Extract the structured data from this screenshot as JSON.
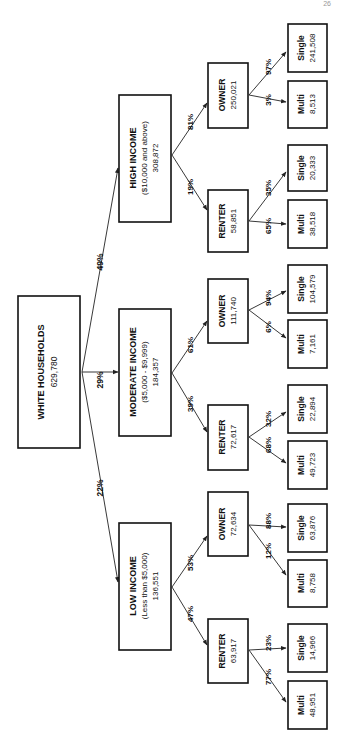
{
  "page_number": "26",
  "root": {
    "title": "WHITE HOUSEHOLDS",
    "value": "629,780"
  },
  "income": {
    "high": {
      "title": "HIGH INCOME",
      "range": "($10,000 and above)",
      "value": "308,872",
      "pct": "49%"
    },
    "moderate": {
      "title": "MODERATE INCOME",
      "range": "($5,000 - $9,999)",
      "value": "184,357",
      "pct": "29%"
    },
    "low": {
      "title": "LOW INCOME",
      "range": "(Less than $5,000)",
      "value": "136,551",
      "pct": "22%"
    }
  },
  "tenure": {
    "high_owner": {
      "title": "OWNER",
      "value": "250,021",
      "pct": "81%"
    },
    "high_renter": {
      "title": "RENTER",
      "value": "58,851",
      "pct": "19%"
    },
    "mod_owner": {
      "title": "OWNER",
      "value": "111,740",
      "pct": "61%"
    },
    "mod_renter": {
      "title": "RENTER",
      "value": "72,617",
      "pct": "39%"
    },
    "low_owner": {
      "title": "OWNER",
      "value": "72,634",
      "pct": "53%"
    },
    "low_renter": {
      "title": "RENTER",
      "value": "63,917",
      "pct": "47%"
    }
  },
  "leaves": {
    "high_owner_single": {
      "title": "Single",
      "value": "241,508",
      "pct": "97%"
    },
    "high_owner_multi": {
      "title": "Multi",
      "value": "8,513",
      "pct": "3%"
    },
    "high_renter_single": {
      "title": "Single",
      "value": "20,333",
      "pct": "35%"
    },
    "high_renter_multi": {
      "title": "Multi",
      "value": "38,518",
      "pct": "65%"
    },
    "mod_owner_single": {
      "title": "Single",
      "value": "104,579",
      "pct": "94%"
    },
    "mod_owner_multi": {
      "title": "Multi",
      "value": "7,161",
      "pct": "6%"
    },
    "mod_renter_single": {
      "title": "Single",
      "value": "22,894",
      "pct": "32%"
    },
    "mod_renter_multi": {
      "title": "Multi",
      "value": "49,723",
      "pct": "68%"
    },
    "low_owner_single": {
      "title": "Single",
      "value": "63,876",
      "pct": "88%"
    },
    "low_owner_multi": {
      "title": "Multi",
      "value": "8,758",
      "pct": "12%"
    },
    "low_renter_single": {
      "title": "Single",
      "value": "14,966",
      "pct": "23%"
    },
    "low_renter_multi": {
      "title": "Multi",
      "value": "48,951",
      "pct": "77%"
    }
  }
}
